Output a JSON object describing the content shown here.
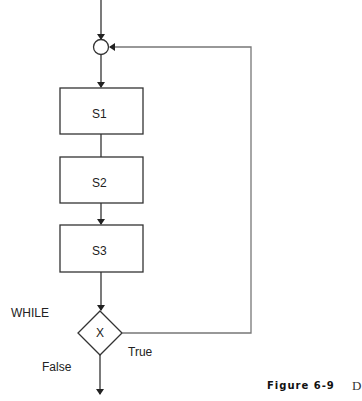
{
  "diagram": {
    "type": "flowchart",
    "nodes": {
      "s1": "S1",
      "s2": "S2",
      "s3": "S3",
      "decision": "X"
    },
    "labels": {
      "while": "WHILE",
      "true": "True",
      "false": "False"
    },
    "caption": {
      "figure": "Figure 6-9",
      "trailing": "D"
    },
    "colors": {
      "stroke": "#333333",
      "loop_stroke": "#777777"
    }
  }
}
